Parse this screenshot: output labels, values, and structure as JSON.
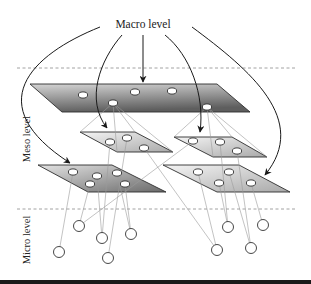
{
  "labels": {
    "macro": "Macro level",
    "meso": "Meso level",
    "micro": "Micro level"
  },
  "colors": {
    "arrow": "#1a1a1a",
    "plane_border": "#2e2e2e",
    "thin_line": "#9a9a9a",
    "dashed_line": "#8a8a8a",
    "node_fill": "#ffffff",
    "node_stroke": "#333333"
  },
  "dividers": [
    {
      "name": "macro-meso-divider",
      "y": 68,
      "x1": 17,
      "x2": 297
    },
    {
      "name": "meso-micro-divider",
      "y": 209,
      "x1": 17,
      "x2": 297
    }
  ],
  "planes": [
    {
      "name": "macro-plane",
      "gradient": "dark",
      "points": [
        [
          30,
          84
        ],
        [
          217,
          84
        ],
        [
          250,
          112
        ],
        [
          62,
          112
        ]
      ],
      "nodes": [
        [
          83,
          95
        ],
        [
          135,
          92
        ],
        [
          172,
          91
        ],
        [
          113,
          103
        ],
        [
          207,
          107
        ]
      ]
    },
    {
      "name": "meso-plane-upper-left",
      "gradient": "light",
      "points": [
        [
          80,
          132
        ],
        [
          135,
          132
        ],
        [
          173,
          152
        ],
        [
          117,
          152
        ]
      ],
      "nodes": [
        [
          110,
          142
        ],
        [
          127,
          138
        ],
        [
          144,
          148
        ]
      ]
    },
    {
      "name": "meso-plane-upper-right",
      "gradient": "light",
      "points": [
        [
          174,
          137
        ],
        [
          232,
          137
        ],
        [
          267,
          157
        ],
        [
          213,
          157
        ]
      ],
      "nodes": [
        [
          193,
          141
        ],
        [
          220,
          142
        ],
        [
          237,
          151
        ]
      ]
    },
    {
      "name": "meso-plane-lower-left",
      "gradient": "medium",
      "points": [
        [
          38,
          165
        ],
        [
          112,
          165
        ],
        [
          166,
          192
        ],
        [
          88,
          192
        ]
      ],
      "nodes": [
        [
          73,
          172
        ],
        [
          97,
          176
        ],
        [
          117,
          173
        ],
        [
          90,
          184
        ],
        [
          125,
          184
        ]
      ]
    },
    {
      "name": "meso-plane-lower-right",
      "gradient": "light",
      "points": [
        [
          163,
          165
        ],
        [
          239,
          165
        ],
        [
          290,
          192
        ],
        [
          217,
          192
        ]
      ],
      "nodes": [
        [
          198,
          172
        ],
        [
          229,
          172
        ],
        [
          219,
          183
        ],
        [
          251,
          183
        ]
      ]
    }
  ],
  "micro_nodes": [
    [
      79,
      226
    ],
    [
      102,
      238
    ],
    [
      131,
      234
    ],
    [
      59,
      252
    ],
    [
      108,
      258
    ],
    [
      228,
      227
    ],
    [
      263,
      225
    ],
    [
      217,
      250
    ],
    [
      251,
      248
    ]
  ],
  "thin_lines": [
    [
      [
        113,
        103
      ],
      [
        80,
        132
      ]
    ],
    [
      [
        113,
        103
      ],
      [
        135,
        132
      ]
    ],
    [
      [
        113,
        103
      ],
      [
        117,
        152
      ]
    ],
    [
      [
        113,
        103
      ],
      [
        173,
        152
      ]
    ],
    [
      [
        207,
        107
      ],
      [
        174,
        137
      ]
    ],
    [
      [
        207,
        107
      ],
      [
        232,
        137
      ]
    ],
    [
      [
        207,
        107
      ],
      [
        213,
        157
      ]
    ],
    [
      [
        207,
        107
      ],
      [
        267,
        157
      ]
    ],
    [
      [
        110,
        142
      ],
      [
        102,
        238
      ]
    ],
    [
      [
        127,
        138
      ],
      [
        108,
        258
      ]
    ],
    [
      [
        144,
        148
      ],
      [
        217,
        250
      ]
    ],
    [
      [
        193,
        141
      ],
      [
        79,
        226
      ]
    ],
    [
      [
        220,
        142
      ],
      [
        228,
        227
      ]
    ],
    [
      [
        237,
        151
      ],
      [
        251,
        248
      ]
    ],
    [
      [
        73,
        172
      ],
      [
        59,
        252
      ]
    ],
    [
      [
        90,
        184
      ],
      [
        79,
        226
      ]
    ],
    [
      [
        97,
        176
      ],
      [
        102,
        238
      ]
    ],
    [
      [
        125,
        184
      ],
      [
        131,
        234
      ]
    ],
    [
      [
        117,
        173
      ],
      [
        131,
        234
      ]
    ],
    [
      [
        198,
        172
      ],
      [
        217,
        250
      ]
    ],
    [
      [
        219,
        183
      ],
      [
        228,
        227
      ]
    ],
    [
      [
        229,
        172
      ],
      [
        251,
        248
      ]
    ],
    [
      [
        251,
        183
      ],
      [
        263,
        225
      ]
    ]
  ],
  "arrows": [
    {
      "name": "arrow-to-lower-left-plane",
      "d": "M100,27 C30,55 -20,105 70,163"
    },
    {
      "name": "arrow-to-upper-left-plane",
      "d": "M122,35 C100,60 85,100 107,128"
    },
    {
      "name": "arrow-to-macro-plane",
      "d": "M143,35 L143,82"
    },
    {
      "name": "arrow-to-upper-right-plane",
      "d": "M165,35 C190,55 205,95 200,132"
    },
    {
      "name": "arrow-to-lower-right-plane",
      "d": "M192,27 C250,70 310,120 265,175"
    }
  ]
}
